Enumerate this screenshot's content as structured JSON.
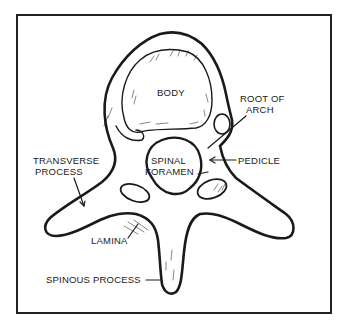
{
  "diagram": {
    "colors": {
      "ink": "#1a1a1a",
      "frame": "#222222",
      "background": "#ffffff"
    },
    "labels": {
      "body": "BODY",
      "root_of_arch_line1": "ROOT OF",
      "root_of_arch_line2": "ARCH",
      "pedicle": "PEDICLE",
      "spinal_foramen_line1": "SPINAL",
      "spinal_foramen_line2": "FORAMEN",
      "transverse_process_line1": "TRANSVERSE",
      "transverse_process_line2": "PROCESS",
      "lamina": "LAMINA",
      "spinous_process": "SPINOUS PROCESS"
    }
  }
}
